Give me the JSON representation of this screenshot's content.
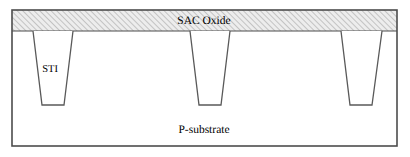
{
  "figure": {
    "type": "semiconductor-cross-section",
    "canvas": {
      "width": 410,
      "height": 157
    },
    "colors": {
      "outline": "#4d4d4d",
      "trench_outline": "#595959",
      "hatch_line": "#9a9a9a",
      "oxide_fill": "#ececec",
      "substrate_fill": "#ffffff",
      "text": "#000000",
      "background": "#ffffff"
    },
    "labels": {
      "sac_oxide": "SAC Oxide",
      "sti": "STI",
      "p_substrate": "P-substrate"
    },
    "regions": {
      "outer_box": {
        "x": 12,
        "y": 10,
        "width": 385,
        "height": 136
      },
      "sac_oxide_layer": {
        "x": 12,
        "y": 10,
        "width": 385,
        "height": 21,
        "pattern": "diagonal-hatch-45"
      },
      "substrate_layer": {
        "x": 12,
        "y": 31,
        "width": 385,
        "height": 115
      }
    },
    "trenches": [
      {
        "name": "trench-left",
        "top_left": 33,
        "top_right": 73,
        "bottom_left": 42,
        "bottom_right": 64,
        "top_y": 31,
        "bottom_y": 105
      },
      {
        "name": "trench-middle",
        "top_left": 190,
        "top_right": 230,
        "bottom_left": 199,
        "bottom_right": 221,
        "top_y": 31,
        "bottom_y": 105
      },
      {
        "name": "trench-right",
        "top_left": 341,
        "top_right": 382,
        "bottom_left": 350,
        "bottom_right": 372,
        "top_y": 31,
        "bottom_y": 105
      }
    ],
    "label_positions": {
      "sac_oxide": {
        "x": 204,
        "y": 24
      },
      "sti": {
        "x": 50,
        "y": 72
      },
      "p_substrate": {
        "x": 204,
        "y": 133
      }
    }
  }
}
